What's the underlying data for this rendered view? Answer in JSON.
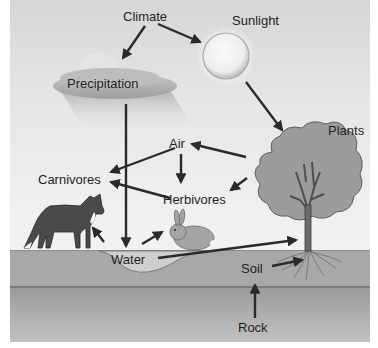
{
  "diagram": {
    "nodes": {
      "climate": "Climate",
      "sunlight": "Sunlight",
      "precipitation": "Precipitation",
      "plants": "Plants",
      "air": "Air",
      "carnivores": "Carnivores",
      "herbivores": "Herbivores",
      "water": "Water",
      "soil": "Soil",
      "rock": "Rock"
    },
    "edges": [
      {
        "from": "Climate",
        "to": "Precipitation"
      },
      {
        "from": "Climate",
        "to": "Sunlight"
      },
      {
        "from": "Sunlight",
        "to": "Plants"
      },
      {
        "from": "Precipitation",
        "to": "Water"
      },
      {
        "from": "Plants",
        "to": "Air"
      },
      {
        "from": "Plants",
        "to": "Herbivores"
      },
      {
        "from": "Air",
        "to": "Carnivores"
      },
      {
        "from": "Air",
        "to": "Herbivores"
      },
      {
        "from": "Herbivores",
        "to": "Carnivores"
      },
      {
        "from": "Water",
        "to": "Carnivores"
      },
      {
        "from": "Water",
        "to": "Herbivores"
      },
      {
        "from": "Water",
        "to": "Plants"
      },
      {
        "from": "Soil",
        "to": "Plants"
      },
      {
        "from": "Rock",
        "to": "Soil"
      }
    ],
    "illustrations": [
      "cloud",
      "sun",
      "tree",
      "fox",
      "rabbit",
      "water-pond",
      "soil-layer",
      "rock-layer"
    ],
    "colors": {
      "arrow": "#2a2a2a",
      "background_top": "#d6d6d6",
      "soil": "#a8a8a8",
      "rock": "#b4b4b4",
      "foliage": "#9a9a9a",
      "fox": "#4a4a4a",
      "rabbit": "#a0a0a0"
    }
  }
}
